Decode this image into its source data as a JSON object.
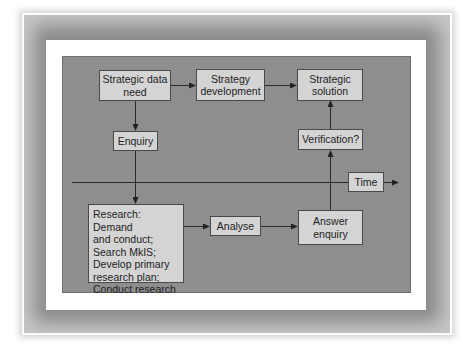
{
  "colors": {
    "frame": "#8a8a8a",
    "card": "#ffffff",
    "panel": "#8e8e8e",
    "box_fill": "#d4d4d4",
    "box_border": "#4a4a4a",
    "line": "#2a2a2a"
  },
  "diagram": {
    "nodes": {
      "strategic_data_need": "Strategic data\nneed",
      "strategy_development": "Strategy\ndevelopment",
      "strategic_solution": "Strategic\nsolution",
      "enquiry": "Enquiry",
      "verification": "Verification?",
      "time": "Time",
      "research": "Research: Demand\nand conduct;\nSearch MkIS;\nDevelop primary\nresearch plan;\nConduct research",
      "analyse": "Analyse",
      "answer_enquiry": "Answer\nenquiry"
    },
    "edges": [
      {
        "from": "strategic_data_need",
        "to": "strategy_development"
      },
      {
        "from": "strategy_development",
        "to": "strategic_solution"
      },
      {
        "from": "strategic_data_need",
        "to": "enquiry"
      },
      {
        "from": "enquiry",
        "to": "research"
      },
      {
        "from": "research",
        "to": "analyse"
      },
      {
        "from": "analyse",
        "to": "answer_enquiry"
      },
      {
        "from": "answer_enquiry",
        "to": "verification"
      },
      {
        "from": "verification",
        "to": "strategic_solution"
      }
    ],
    "time_axis": {
      "label": "Time",
      "direction": "right"
    }
  }
}
